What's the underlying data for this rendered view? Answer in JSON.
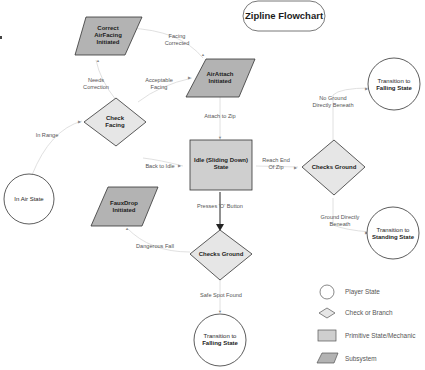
{
  "title": "Zipline Flowchart",
  "colors": {
    "state_fill": "#ffffff",
    "check_fill": "#e6e6e6",
    "primitive_fill": "#cfcfcf",
    "subsystem_fill": "#b3b3b3",
    "stroke": "#333333",
    "edge": "#d8d8d8",
    "edge_strong": "#222222"
  },
  "nodes": {
    "correct_airfacing": {
      "type": "subsystem",
      "lines": [
        "Correct",
        "AirFacing",
        "Initiated"
      ]
    },
    "airattach": {
      "type": "subsystem",
      "lines": [
        "AirAttach",
        "Initiated"
      ]
    },
    "check_facing": {
      "type": "check",
      "lines": [
        "Check",
        "Facing"
      ]
    },
    "in_air_state": {
      "type": "state",
      "lines": [
        "In Air State"
      ]
    },
    "idle_state": {
      "type": "primitive",
      "lines": [
        "Idle (Sliding Down)",
        "State"
      ]
    },
    "checks_ground_right": {
      "type": "check",
      "lines": [
        "Checks Ground"
      ]
    },
    "transition_falling_top": {
      "type": "state",
      "lines": [
        "Transition to",
        "Falling State"
      ]
    },
    "transition_standing": {
      "type": "state",
      "lines": [
        "Transition to",
        "Standing State"
      ]
    },
    "fauxdrop": {
      "type": "subsystem",
      "lines": [
        "FauxDrop",
        "Initiated"
      ]
    },
    "checks_ground_bottom": {
      "type": "check",
      "lines": [
        "Checks Ground"
      ]
    },
    "transition_falling_bottom": {
      "type": "state",
      "lines": [
        "Transition to",
        "Falling State"
      ]
    }
  },
  "edges": [
    {
      "from": "correct_airfacing",
      "to": "airattach",
      "label": [
        "Facing",
        "Corrected"
      ]
    },
    {
      "from": "check_facing",
      "to": "correct_airfacing",
      "label": [
        "Needs",
        "Correction"
      ]
    },
    {
      "from": "check_facing",
      "to": "airattach",
      "label": [
        "Acceptable",
        "Facing"
      ]
    },
    {
      "from": "in_air_state",
      "to": "check_facing",
      "label": [
        "In Range"
      ]
    },
    {
      "from": "airattach",
      "to": "idle_state",
      "label": [
        "Attach to Zip"
      ]
    },
    {
      "from": "fauxdrop",
      "to": "idle_state",
      "label": [
        "Back to Idle"
      ]
    },
    {
      "from": "idle_state",
      "to": "checks_ground_right",
      "label": [
        "Reach End",
        "Of Zip"
      ]
    },
    {
      "from": "checks_ground_right",
      "to": "transition_falling_top",
      "label": [
        "No Ground",
        "Directly Beneath"
      ]
    },
    {
      "from": "checks_ground_right",
      "to": "transition_standing",
      "label": [
        "Ground Directly",
        "Beneath"
      ]
    },
    {
      "from": "idle_state",
      "to": "checks_ground_bottom",
      "label": [
        "Presses 'O' Button"
      ]
    },
    {
      "from": "checks_ground_bottom",
      "to": "fauxdrop",
      "label": [
        "Dangerous Fall"
      ]
    },
    {
      "from": "checks_ground_bottom",
      "to": "transition_falling_bottom",
      "label": [
        "Safe Spot Found"
      ]
    }
  ],
  "legend": [
    {
      "shape": "circle",
      "label": "Player State"
    },
    {
      "shape": "diamond",
      "label": "Check or Branch"
    },
    {
      "shape": "rectangle",
      "label": "Primitive State/Mechanic"
    },
    {
      "shape": "parallelogram",
      "label": "Subsystem"
    }
  ],
  "edge_labels": {
    "facing_corrected": [
      "Facing",
      "Corrected"
    ],
    "needs_correction": [
      "Needs",
      "Correction"
    ],
    "acceptable_facing": [
      "Acceptable",
      "Facing"
    ],
    "in_range": "In Range",
    "attach_to_zip": "Attach to Zip",
    "back_to_idle": "Back to Idle",
    "reach_end": [
      "Reach End",
      "Of Zip"
    ],
    "no_ground": [
      "No Ground",
      "Directly Beneath"
    ],
    "ground_beneath": [
      "Ground Directly",
      "Beneath"
    ],
    "presses_o": "Presses 'O' Button",
    "dangerous_fall": "Dangerous Fall",
    "safe_spot": "Safe Spot Found"
  }
}
